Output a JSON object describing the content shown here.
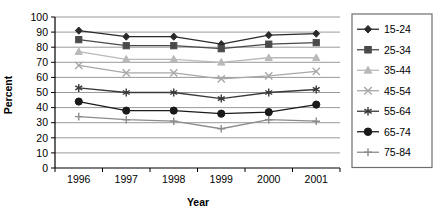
{
  "chart_data": {
    "type": "line",
    "title": "",
    "xlabel": "Year",
    "ylabel": "Percent",
    "categories": [
      "1996",
      "1997",
      "1998",
      "1999",
      "2000",
      "2001"
    ],
    "x": [
      1996,
      1997,
      1998,
      1999,
      2000,
      2001
    ],
    "ylim": [
      0,
      100
    ],
    "yticks": [
      0,
      10,
      20,
      30,
      40,
      50,
      60,
      70,
      80,
      90,
      100
    ],
    "grid": "horizontal",
    "legend_position": "right",
    "series": [
      {
        "name": "15-24",
        "values": [
          91,
          87,
          87,
          82,
          88,
          89
        ],
        "marker": "diamond",
        "color": "#2a2a2a"
      },
      {
        "name": "25-34",
        "values": [
          85,
          81,
          81,
          79,
          82,
          83
        ],
        "marker": "square",
        "color": "#4a4a4a"
      },
      {
        "name": "35-44",
        "values": [
          77,
          72,
          72,
          70,
          73,
          73
        ],
        "marker": "triangle",
        "color": "#b9b9b9"
      },
      {
        "name": "45-54",
        "values": [
          68,
          63,
          63,
          59,
          61,
          64
        ],
        "marker": "x",
        "color": "#a8a8a8"
      },
      {
        "name": "55-64",
        "values": [
          53,
          50,
          50,
          46,
          50,
          52
        ],
        "marker": "asterisk",
        "color": "#3a3a3a"
      },
      {
        "name": "65-74",
        "values": [
          44,
          38,
          38,
          36,
          37,
          42
        ],
        "marker": "circle",
        "color": "#1a1a1a"
      },
      {
        "name": "75-84",
        "values": [
          34,
          32,
          31,
          26,
          32,
          31
        ],
        "marker": "plus",
        "color": "#8c8c8c"
      }
    ]
  },
  "axes": {
    "y_title": "Percent",
    "x_title": "Year",
    "y_tick_labels": [
      "100",
      "90",
      "80",
      "70",
      "60",
      "50",
      "40",
      "30",
      "20",
      "10",
      "0"
    ],
    "x_tick_labels": [
      "1996",
      "1997",
      "1998",
      "1999",
      "2000",
      "2001"
    ]
  },
  "legend": {
    "entries": [
      "15-24",
      "25-34",
      "35-44",
      "45-54",
      "55-64",
      "65-74",
      "75-84"
    ]
  },
  "colors": {
    "axis": "#000000",
    "gridline": "#9a9a9a",
    "legend_border": "#6e6e6e",
    "background": "#ffffff"
  }
}
